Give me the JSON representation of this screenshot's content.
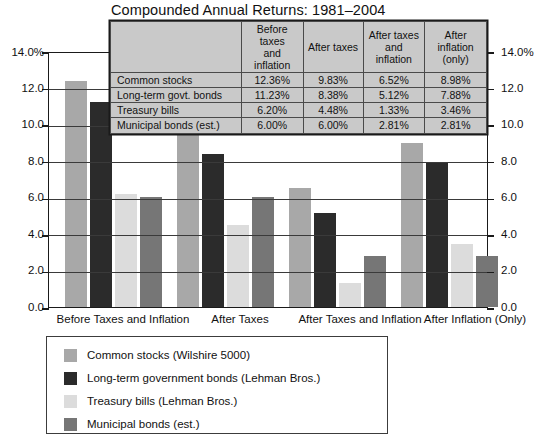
{
  "chart_data": {
    "type": "bar",
    "title": "Compounded Annual Returns: 1981–2004",
    "xlabel": "",
    "ylabel": "",
    "ylim": [
      0,
      14
    ],
    "yticks": [
      "0.0",
      "2.0",
      "4.0",
      "6.0",
      "8.0",
      "10.0",
      "12.0",
      "14.0%"
    ],
    "ytick_values": [
      0,
      2,
      4,
      6,
      8,
      10,
      12,
      14
    ],
    "grid": true,
    "dual_axis": true,
    "legend_position": "bottom-left",
    "categories": [
      "Before Taxes and Inflation",
      "After Taxes",
      "After Taxes and Inflation",
      "After Inflation (Only)"
    ],
    "series": [
      {
        "name": "Common stocks (Wilshire 5000)",
        "short_name": "Common stocks",
        "color": "#a8a8a8",
        "values": [
          12.36,
          9.83,
          6.52,
          8.98
        ],
        "labels": [
          "12.36%",
          "9.83%",
          "6.52%",
          "8.98%"
        ]
      },
      {
        "name": "Long-term government bonds (Lehman Bros.)",
        "short_name": "Long-term govt. bonds",
        "color": "#2b2b2b",
        "values": [
          11.23,
          8.38,
          5.12,
          7.88
        ],
        "labels": [
          "11.23%",
          "8.38%",
          "5.12%",
          "7.88%"
        ]
      },
      {
        "name": "Treasury bills (Lehman Bros.)",
        "short_name": "Treasury bills",
        "color": "#dcdcdc",
        "values": [
          6.2,
          4.48,
          1.33,
          3.46
        ],
        "labels": [
          "6.20%",
          "4.48%",
          "1.33%",
          "3.46%"
        ]
      },
      {
        "name": "Municipal bonds (est.)",
        "short_name": "Municipal bonds (est.)",
        "color": "#767676",
        "values": [
          6.0,
          6.0,
          2.81,
          2.81
        ],
        "labels": [
          "6.00%",
          "6.00%",
          "2.81%",
          "2.81%"
        ]
      }
    ]
  },
  "axis": {
    "left": {
      "t14": "14.0%",
      "t12": "12.0",
      "t10": "10.0",
      "t8": "8.0",
      "t6": "6.0",
      "t4": "4.0",
      "t2": "2.0",
      "t0": "0.0"
    },
    "right": {
      "t14": "14.0%",
      "t12": "12.0",
      "t10": "10.0",
      "t8": "8.0",
      "t6": "6.0",
      "t4": "4.0",
      "t2": "2.0",
      "t0": "0.0"
    }
  },
  "categories": {
    "c0": "Before Taxes and Inflation",
    "c1": "After Taxes",
    "c2": "After Taxes and Inflation",
    "c3": "After Inflation (Only)"
  },
  "table": {
    "corner": "",
    "headers": {
      "h1": "Before taxes and inflation",
      "h1a": "Before taxes",
      "h1b": "and inflation",
      "h2": "After taxes",
      "h3a": "After taxes",
      "h3b": "and inflation",
      "h4a": "After",
      "h4b": "inflation (only)"
    },
    "rows": [
      {
        "name": "Common stocks",
        "v1": "12.36%",
        "v2": "9.83%",
        "v3": "6.52%",
        "v4": "8.98%"
      },
      {
        "name": "Long-term govt. bonds",
        "v1": "11.23%",
        "v2": "8.38%",
        "v3": "5.12%",
        "v4": "7.88%"
      },
      {
        "name": "Treasury bills",
        "v1": "6.20%",
        "v2": "4.48%",
        "v3": "1.33%",
        "v4": "3.46%"
      },
      {
        "name": "Municipal bonds (est.)",
        "v1": "6.00%",
        "v2": "6.00%",
        "v3": "2.81%",
        "v4": "2.81%"
      }
    ]
  },
  "legend": {
    "items": [
      {
        "label": "Common stocks (Wilshire 5000)",
        "color": "#a8a8a8"
      },
      {
        "label": "Long-term government bonds (Lehman Bros.)",
        "color": "#2b2b2b"
      },
      {
        "label": "Treasury bills (Lehman Bros.)",
        "color": "#dcdcdc"
      },
      {
        "label": "Municipal bonds (est.)",
        "color": "#767676"
      }
    ]
  },
  "colors": {
    "common_stocks": "#a8a8a8",
    "long_term_gov": "#2b2b2b",
    "treasury_bills": "#dcdcdc",
    "municipal_bonds": "#767676",
    "axis": "#1a1a1a",
    "grid": "#3a3a3a",
    "table_fill": "#c9c9c9"
  }
}
